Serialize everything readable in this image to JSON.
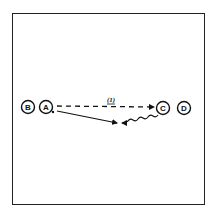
{
  "diagram": {
    "type": "play-diagram",
    "border_color": "#222222",
    "ink_color": "#111111",
    "players": [
      {
        "id": "B",
        "label": "B",
        "x": 28,
        "y": 107
      },
      {
        "id": "A",
        "label": "A",
        "x": 46,
        "y": 107
      },
      {
        "id": "C",
        "label": "C",
        "x": 163,
        "y": 108
      },
      {
        "id": "D",
        "label": "D",
        "x": 184,
        "y": 108
      }
    ],
    "arrows": [
      {
        "id": "pass",
        "from": "A",
        "to": "C",
        "style": "dashed",
        "label": "(1)"
      },
      {
        "id": "run-a",
        "from": "A",
        "to": "meeting-point",
        "style": "solid"
      },
      {
        "id": "dribble-c",
        "from": "C",
        "to": "meeting-point",
        "style": "wavy"
      }
    ],
    "pass_label": "(1)"
  }
}
